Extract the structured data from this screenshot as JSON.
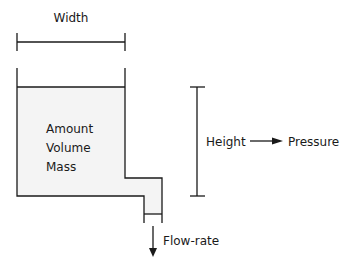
{
  "diagram": {
    "width_label": "Width",
    "tank_labels": [
      "Amount",
      "Volume",
      "Mass"
    ],
    "height_label": "Height",
    "pressure_label": "Pressure",
    "flow_label": "Flow-rate",
    "colors": {
      "stroke": "#1a1a1a",
      "fill": "#f4f4f4",
      "background": "#ffffff"
    }
  }
}
